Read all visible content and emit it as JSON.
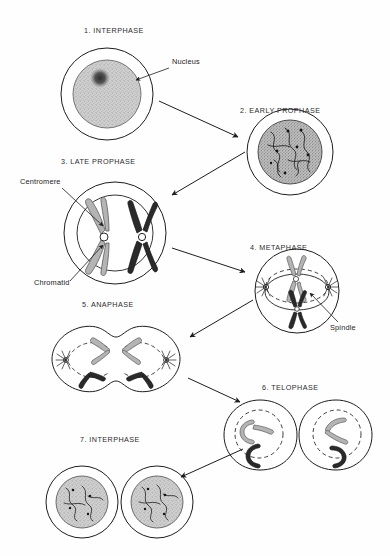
{
  "figure": {
    "domain": "diagram",
    "background_color": "#fefefe",
    "ink_color": "#1d1d1d",
    "chromosome_gray": "#b4b4b4",
    "chromosome_dark": "#2a2a2a",
    "nucleus_fill": "#c9c9c9",
    "width": 390,
    "height": 556
  },
  "stages": [
    {
      "id": "interphase-1",
      "number": "1.",
      "label": "1. INTERPHASE",
      "label_x": 84,
      "label_y": 32,
      "cell_cx": 107,
      "cell_cy": 94,
      "cell_r": 46,
      "nucleus_r": 34,
      "description": "Round cell with large stippled nucleus and dense dark nucleolus"
    },
    {
      "id": "early-prophase-2",
      "number": "2.",
      "label": "2. EARLY PROPHASE",
      "label_x": 240,
      "label_y": 112,
      "cell_cx": 290,
      "cell_cy": 152,
      "cell_r": 43,
      "nucleus_r": 32,
      "description": "Nucleus filled with long tangled chromatin threads bearing dark centromere dots"
    },
    {
      "id": "late-prophase-3",
      "number": "3.",
      "label": "3. LATE PROPHASE",
      "label_x": 61,
      "label_y": 163,
      "cell_cx": 115,
      "cell_cy": 233,
      "cell_r": 51,
      "nucleus_r": 38,
      "description": "Two condensed X-shaped chromosomes, one light and one dark, each with a white centromere"
    },
    {
      "id": "metaphase-4",
      "number": "4.",
      "label": "4. METAPHASE",
      "label_x": 243,
      "label_y": 249,
      "cell_cx": 297,
      "cell_cy": 291,
      "cell_r": 42,
      "description": "Spindle with asters at both poles; chromosomes aligned on the equator"
    },
    {
      "id": "anaphase-5",
      "number": "5.",
      "label": "5. ANAPHASE",
      "label_x": 82,
      "label_y": 306,
      "cell_cx": 116,
      "cell_cy": 359,
      "description": "Dumbbell shaped cell with cleavage furrow; V-shaped chromatids pulled toward opposite poles"
    },
    {
      "id": "telophase-6",
      "number": "6.",
      "label": "6. TELOPHASE",
      "label_x": 256,
      "label_y": 389,
      "cell_cx": 297,
      "cell_cy": 435,
      "description": "Two daughter cells nearly pinched apart, each with a dashed reforming nuclear envelope"
    },
    {
      "id": "interphase-7",
      "number": "7.",
      "label": "7. INTERPHASE",
      "label_x": 80,
      "label_y": 441,
      "cell_cx": 82,
      "cell_cy": 502,
      "description": "Two separate daughter cells with stippled nuclei containing chromatin threads"
    }
  ],
  "annotations": [
    {
      "id": "nucleus",
      "label": "Nucleus",
      "label_x": 172,
      "label_y": 62,
      "leader_from_x": 169,
      "leader_from_y": 68,
      "leader_to_x": 136,
      "leader_to_y": 80
    },
    {
      "id": "centromere",
      "label": "Centromere",
      "label_x": 20,
      "label_y": 182,
      "leader_from_x": 62,
      "leader_from_y": 188,
      "leader_to_x": 103,
      "leader_to_y": 226
    },
    {
      "id": "chromatid",
      "label": "Chromatid",
      "label_x": 34,
      "label_y": 283,
      "leader_from_x": 70,
      "leader_from_y": 281,
      "leader_to_x": 103,
      "leader_to_y": 245
    },
    {
      "id": "spindle",
      "label": "Spindle",
      "label_x": 330,
      "label_y": 328,
      "leader_from_x": 338,
      "leader_from_y": 322,
      "leader_to_x": 310,
      "leader_to_y": 293
    }
  ],
  "arrows": [
    {
      "id": "arrow-1-to-2",
      "from_stage": "interphase-1",
      "to_stage": "early-prophase-2",
      "x1": 159,
      "y1": 101,
      "x2": 238,
      "y2": 137
    },
    {
      "id": "arrow-2-to-3",
      "from_stage": "early-prophase-2",
      "to_stage": "late-prophase-3",
      "x1": 245,
      "y1": 152,
      "x2": 172,
      "y2": 195
    },
    {
      "id": "arrow-3-to-4",
      "from_stage": "late-prophase-3",
      "to_stage": "metaphase-4",
      "x1": 172,
      "y1": 248,
      "x2": 245,
      "y2": 272
    },
    {
      "id": "arrow-4-to-5",
      "from_stage": "metaphase-4",
      "to_stage": "anaphase-5",
      "x1": 253,
      "y1": 300,
      "x2": 190,
      "y2": 337
    },
    {
      "id": "arrow-5-to-6",
      "from_stage": "anaphase-5",
      "to_stage": "telophase-6",
      "x1": 188,
      "y1": 378,
      "x2": 240,
      "y2": 402
    },
    {
      "id": "arrow-6-to-7",
      "from_stage": "telophase-6",
      "to_stage": "interphase-7",
      "x1": 243,
      "y1": 449,
      "x2": 181,
      "y2": 477
    }
  ]
}
